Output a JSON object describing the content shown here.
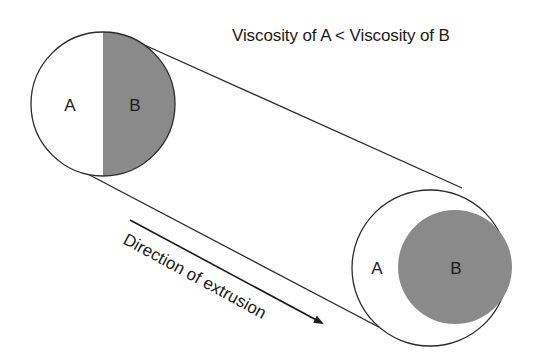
{
  "title": "Viscosity of A < Viscosity of B",
  "arrow_label": "Direction of extrusion",
  "left_section": {
    "label_a": "A",
    "label_b": "B",
    "layout": "side-by-side halves"
  },
  "right_section": {
    "label_a": "A",
    "label_b": "B",
    "layout": "B encapsulated within A"
  },
  "colors": {
    "component_a": "#ffffff",
    "component_b": "#8a8a8a",
    "outline": "#2a2a2a"
  }
}
